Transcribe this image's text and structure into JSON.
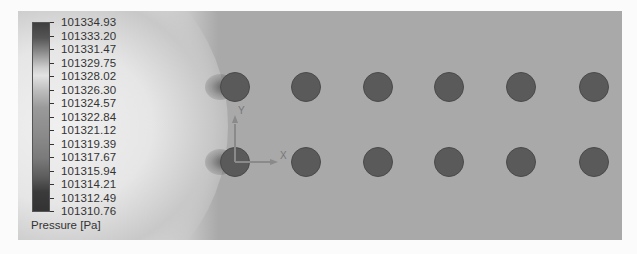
{
  "legend": {
    "title": "Pressure [Pa]",
    "labels": [
      "101334.93",
      "101333.20",
      "101331.47",
      "101329.75",
      "101328.02",
      "101326.30",
      "101324.57",
      "101322.84",
      "101321.12",
      "101319.39",
      "101317.67",
      "101315.94",
      "101314.21",
      "101312.49",
      "101310.76"
    ]
  },
  "axes": {
    "x_label": "X",
    "y_label": "Y"
  },
  "colors": {
    "background": "#a9a9a9",
    "cylinder": "#5a5a5a",
    "high_pressure": "#e8e8e8"
  },
  "cylinders": {
    "rows": 2,
    "columns": 6,
    "row_y": [
      87,
      162
    ],
    "col_x": [
      235,
      306,
      378,
      449,
      521,
      594
    ],
    "radius": 15
  }
}
